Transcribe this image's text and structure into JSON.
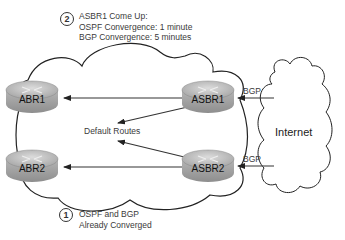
{
  "diagram": {
    "step2": {
      "number": "2",
      "lines": [
        "ASBR1 Come Up:",
        "OSPF Convergence: 1 minute",
        "BGP Convergence: 5 minutes"
      ]
    },
    "step1": {
      "number": "1",
      "lines": [
        "OSPF and BGP",
        "Already Converged"
      ]
    },
    "routers": {
      "abr1": "ABR1",
      "abr2": "ABR2",
      "asbr1": "ASBR1",
      "asbr2": "ASBR2"
    },
    "center_label": "Default Routes",
    "bgp_label_top": "BGP",
    "bgp_label_bottom": "BGP",
    "internet_label": "Internet",
    "colors": {
      "router_body": "#a9a9a9",
      "router_top": "#c8c8c8",
      "line": "#333333"
    }
  }
}
